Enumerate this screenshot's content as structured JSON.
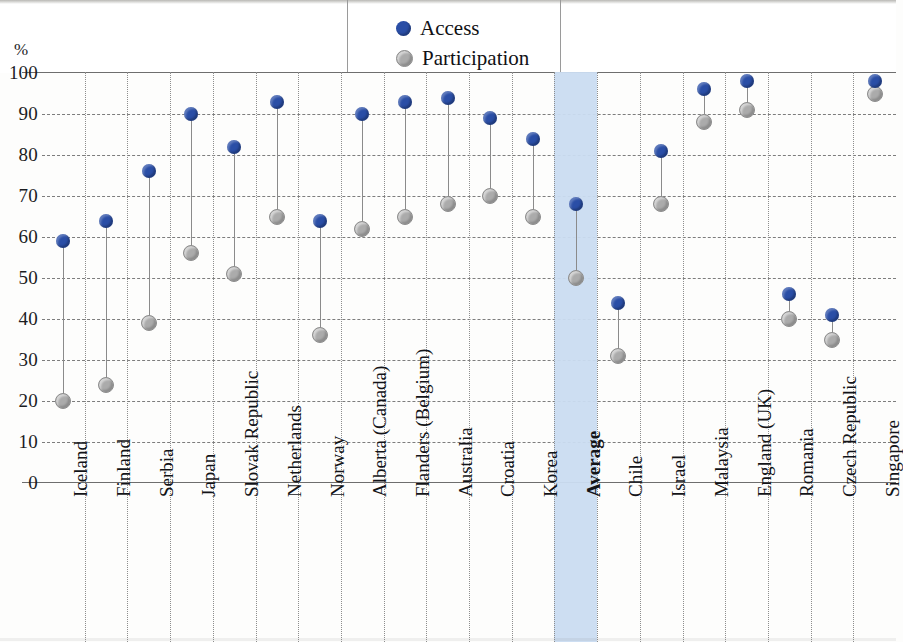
{
  "axis": {
    "y_unit_label": "%",
    "y_ticks": [
      100,
      90,
      80,
      70,
      60,
      50,
      40,
      30,
      20,
      10,
      0
    ]
  },
  "legend": {
    "items": [
      {
        "label": "Access",
        "color": "#2a4ea6",
        "marker": "circle"
      },
      {
        "label": "Participation",
        "color": "#ababab",
        "marker": "circle"
      }
    ]
  },
  "highlight": {
    "category": "Average",
    "color": "#cadcf1"
  },
  "chart_data": {
    "type": "scatter",
    "title": "",
    "subtitle": "",
    "xlabel": "",
    "ylabel": "%",
    "ylim": [
      0,
      100
    ],
    "ytick_step": 10,
    "grid": "both",
    "legend_position": "top-center",
    "highlighted_category": "Average",
    "categories": [
      "Iceland",
      "Finland",
      "Serbia",
      "Japan",
      "Slovak Republic",
      "Netherlands",
      "Norway",
      "Alberta (Canada)",
      "Flanders (Belgium)",
      "Australia",
      "Croatia",
      "Korea",
      "Average",
      "Chile",
      "Israel",
      "Malaysia",
      "England (UK)",
      "Romania",
      "Czech Republic",
      "Singapore"
    ],
    "series": [
      {
        "name": "Access",
        "color": "#2a4ea6",
        "values": [
          59,
          64,
          76,
          90,
          82,
          93,
          64,
          90,
          93,
          94,
          89,
          84,
          68,
          44,
          81,
          96,
          98,
          46,
          41,
          98
        ]
      },
      {
        "name": "Participation",
        "color": "#ababab",
        "values": [
          20,
          24,
          39,
          56,
          51,
          65,
          36,
          62,
          65,
          68,
          70,
          65,
          50,
          31,
          68,
          88,
          91,
          40,
          35,
          95
        ]
      }
    ]
  }
}
